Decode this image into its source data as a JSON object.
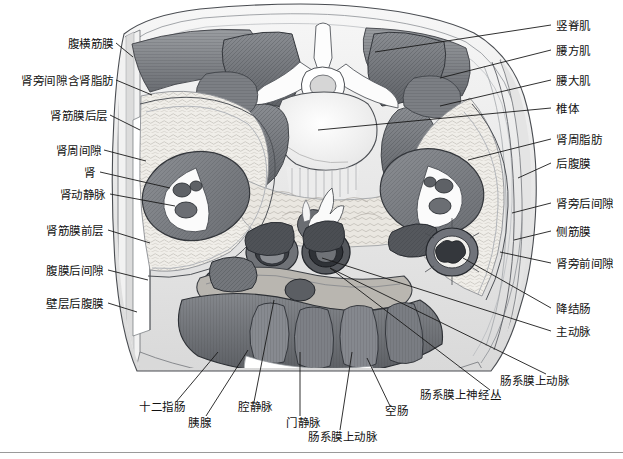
{
  "figure": {
    "kind": "anatomical-cross-section",
    "title": "",
    "orientation": "axial / transverse abdominal section at renal level",
    "style": "grayscale pen-and-ink medical illustration",
    "colors": {
      "background": "#ffffff",
      "ink": "#111111",
      "leader_line": "#1a1a1a",
      "muscle_dark": "#6f7276",
      "muscle_mid": "#8d9094",
      "fat_light": "#eceae6",
      "bone_white": "#fbfbfb",
      "organ_gray": "#7e8186",
      "vessel_dark": "#3f4246",
      "outline": "#2a2a2a",
      "rule": "#9a9a9a"
    }
  },
  "labels_left": [
    {
      "id": "transversalis-fascia",
      "text": "腹横筋膜",
      "x": 58,
      "y": 45,
      "tip_x": 133,
      "tip_y": 57
    },
    {
      "id": "pararenal-space-fat",
      "text": "肾旁间隙含肾脂肪",
      "x": 14,
      "y": 82,
      "tip_x": 152,
      "tip_y": 95
    },
    {
      "id": "posterior-renal-fascia",
      "text": "肾筋膜后层",
      "x": 40,
      "y": 117,
      "tip_x": 140,
      "tip_y": 130
    },
    {
      "id": "perirenal-space",
      "text": "肾周间隙",
      "x": 52,
      "y": 152,
      "tip_x": 146,
      "tip_y": 161
    },
    {
      "id": "kidney",
      "text": "肾",
      "x": 87,
      "y": 174,
      "tip_x": 170,
      "tip_y": 188
    },
    {
      "id": "renal-artery-vein",
      "text": "肾动静脉",
      "x": 52,
      "y": 196,
      "tip_x": 175,
      "tip_y": 206
    },
    {
      "id": "anterior-renal-fascia",
      "text": "肾筋膜前层",
      "x": 40,
      "y": 232,
      "tip_x": 150,
      "tip_y": 243
    },
    {
      "id": "retroperitoneal-space",
      "text": "腹膜后间隙",
      "x": 40,
      "y": 272,
      "tip_x": 148,
      "tip_y": 280
    },
    {
      "id": "parietal-retroperitoneum",
      "text": "壁层后腹膜",
      "x": 40,
      "y": 305,
      "tip_x": 137,
      "tip_y": 312
    }
  ],
  "labels_right": [
    {
      "id": "erector-spinae",
      "text": "竖脊肌",
      "x": 556,
      "y": 27,
      "tip_x": 375,
      "tip_y": 52
    },
    {
      "id": "quadratus-lumborum",
      "text": "腰方肌",
      "x": 556,
      "y": 52,
      "tip_x": 440,
      "tip_y": 78
    },
    {
      "id": "psoas-major",
      "text": "腰大肌",
      "x": 556,
      "y": 82,
      "tip_x": 440,
      "tip_y": 106
    },
    {
      "id": "vertebral-body",
      "text": "椎体",
      "x": 556,
      "y": 110,
      "tip_x": 318,
      "tip_y": 130
    },
    {
      "id": "perirenal-fat",
      "text": "肾周脂肪",
      "x": 556,
      "y": 141,
      "tip_x": 468,
      "tip_y": 160
    },
    {
      "id": "retroperitoneum",
      "text": "后腹膜",
      "x": 556,
      "y": 165,
      "tip_x": 518,
      "tip_y": 178
    },
    {
      "id": "posterior-pararenal-space",
      "text": "肾旁后间隙",
      "x": 556,
      "y": 205,
      "tip_x": 512,
      "tip_y": 213
    },
    {
      "id": "lateroconal-fascia",
      "text": "侧筋膜",
      "x": 556,
      "y": 233,
      "tip_x": 514,
      "tip_y": 240
    },
    {
      "id": "anterior-pararenal-space",
      "text": "肾旁前间隙",
      "x": 556,
      "y": 265,
      "tip_x": 500,
      "tip_y": 252
    },
    {
      "id": "descending-colon",
      "text": "降结肠",
      "x": 556,
      "y": 310,
      "tip_x": 463,
      "tip_y": 258
    },
    {
      "id": "aorta",
      "text": "主动脉",
      "x": 556,
      "y": 333,
      "tip_x": 322,
      "tip_y": 258
    },
    {
      "id": "superior-mesenteric-artery-r",
      "text": "肠系膜上动脉",
      "x": 500,
      "y": 382,
      "tip_x": 330,
      "tip_y": 268
    }
  ],
  "labels_bottom": [
    {
      "id": "duodenum",
      "text": "十二指肠",
      "x": 139,
      "y": 408,
      "tip_x": 218,
      "tip_y": 352
    },
    {
      "id": "pancreas",
      "text": "胰腺",
      "x": 188,
      "y": 424,
      "tip_x": 248,
      "tip_y": 350
    },
    {
      "id": "inferior-vena-cava",
      "text": "腔静脉",
      "x": 238,
      "y": 408,
      "tip_x": 274,
      "tip_y": 300
    },
    {
      "id": "portal-vein",
      "text": "门静脉",
      "x": 286,
      "y": 424,
      "tip_x": 300,
      "tip_y": 352
    },
    {
      "id": "superior-mesenteric-artery-b",
      "text": "肠系膜上动脉",
      "x": 308,
      "y": 438,
      "tip_x": 352,
      "tip_y": 352
    },
    {
      "id": "jejunum",
      "text": "空肠",
      "x": 385,
      "y": 412,
      "tip_x": 367,
      "tip_y": 358
    },
    {
      "id": "superior-mesenteric-plexus",
      "text": "肠系膜上神经丛",
      "x": 420,
      "y": 396,
      "tip_x": 330,
      "tip_y": 268
    }
  ]
}
